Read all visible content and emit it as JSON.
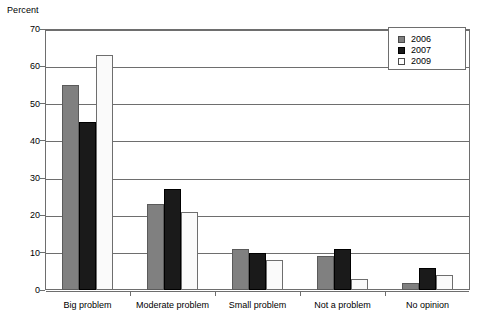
{
  "chart_data": {
    "type": "bar",
    "title": "",
    "subtitle": "",
    "xlabel": "",
    "ylabel": "Percent",
    "ylim": [
      0,
      70
    ],
    "yticks": [
      0,
      10,
      20,
      30,
      40,
      50,
      60,
      70
    ],
    "ytick_labels": [
      "0",
      "10",
      "20",
      "30",
      "40",
      "50",
      "60",
      "70"
    ],
    "grid": "horizontal",
    "legend_position": "top-right",
    "categories": [
      "Big problem",
      "Moderate problem",
      "Small problem",
      "Not a problem",
      "No opinion"
    ],
    "series": [
      {
        "name": "2006",
        "color": "#808080",
        "values": [
          55,
          23,
          11,
          9,
          2
        ]
      },
      {
        "name": "2007",
        "color": "#1a1a1a",
        "values": [
          45,
          27,
          10,
          11,
          6
        ]
      },
      {
        "name": "2009",
        "color": "#fafafa",
        "values": [
          63,
          21,
          8,
          3,
          4
        ]
      }
    ]
  },
  "legend": {
    "items": [
      {
        "label": "2006",
        "swatch": "legend-swatch-2006"
      },
      {
        "label": "2007",
        "swatch": "legend-swatch-2007"
      },
      {
        "label": "2009",
        "swatch": "legend-swatch-2009"
      }
    ]
  },
  "colors": {
    "series_2006": "#808080",
    "series_2007": "#1a1a1a",
    "series_2009": "#fafafa",
    "axis": "#6e6e6e",
    "text": "#000000",
    "background": "#ffffff"
  }
}
